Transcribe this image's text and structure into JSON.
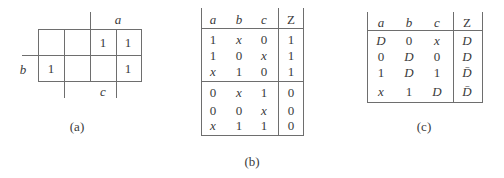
{
  "figure_a": {
    "caption": "(a)",
    "var_top": "a",
    "var_left": "b",
    "var_bottom": "c",
    "cells": [
      [
        "",
        "",
        "1",
        "1"
      ],
      [
        "1",
        "",
        "",
        "1"
      ]
    ]
  },
  "figure_b": {
    "caption": "(b)",
    "headers": [
      "a",
      "b",
      "c",
      "Z"
    ],
    "rows": [
      [
        "1",
        "x",
        "0",
        "1"
      ],
      [
        "1",
        "0",
        "x",
        "1"
      ],
      [
        "x",
        "1",
        "0",
        "1"
      ],
      [
        "0",
        "x",
        "1",
        "0"
      ],
      [
        "0",
        "0",
        "x",
        "0"
      ],
      [
        "x",
        "1",
        "1",
        "0"
      ]
    ]
  },
  "figure_c": {
    "caption": "(c)",
    "headers": [
      "a",
      "b",
      "c",
      "Z"
    ],
    "rows": [
      [
        "D",
        "0",
        "x",
        "D"
      ],
      [
        "0",
        "D",
        "0",
        "D"
      ],
      [
        "1",
        "D",
        "1",
        "D̄"
      ],
      [
        "x",
        "1",
        "D",
        "D̄"
      ]
    ]
  }
}
